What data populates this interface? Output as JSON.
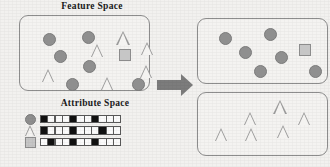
{
  "figure": {
    "width": 330,
    "height": 167,
    "background_color": "#f2f1ef"
  },
  "colors": {
    "shape_fill": "#8f8f8f",
    "shape_outline": "#7b7b7b",
    "triangle_outline": "#9a9a9a",
    "square_fill": "#c6c6c6",
    "square_outline": "#8c8c8c",
    "panel_border": "#8d8d8d",
    "cell_on": "#111111",
    "cell_off": "#fbfbfb",
    "arrow": "#7c7c7c",
    "title_text": "#1a1a1a"
  },
  "panels": {
    "feature_space": {
      "title": "Feature Space",
      "shapes": [
        {
          "type": "circle",
          "x": 24,
          "y": 18,
          "size": 13
        },
        {
          "type": "circle",
          "x": 63,
          "y": 16,
          "size": 13
        },
        {
          "type": "triangle",
          "x": 72,
          "y": 29,
          "size": 13
        },
        {
          "type": "triangle",
          "x": 97,
          "y": 16,
          "size": 14
        },
        {
          "type": "triangle",
          "x": 122,
          "y": 27,
          "size": 13
        },
        {
          "type": "circle",
          "x": 35,
          "y": 35,
          "size": 13
        },
        {
          "type": "square",
          "x": 100,
          "y": 34,
          "size": 12
        },
        {
          "type": "circle",
          "x": 64,
          "y": 45,
          "size": 13
        },
        {
          "type": "triangle",
          "x": 23,
          "y": 54,
          "size": 13
        },
        {
          "type": "triangle",
          "x": 121,
          "y": 50,
          "size": 13
        },
        {
          "type": "circle",
          "x": 47,
          "y": 63,
          "size": 13
        },
        {
          "type": "triangle",
          "x": 82,
          "y": 62,
          "size": 13
        },
        {
          "type": "circle",
          "x": 113,
          "y": 63,
          "size": 13
        }
      ]
    },
    "attribute_space": {
      "title": "Attribute Space",
      "legend": [
        {
          "icon": "circle-icon",
          "shape": "circle"
        },
        {
          "icon": "triangle-icon",
          "shape": "triangle"
        },
        {
          "icon": "square-icon",
          "shape": "square"
        }
      ],
      "rows": [
        {
          "label": "circle-attributes",
          "bits": [
            1,
            0,
            0,
            0,
            1,
            0,
            0,
            1,
            0,
            0,
            0
          ]
        },
        {
          "label": "triangle-attributes",
          "bits": [
            1,
            0,
            0,
            0,
            1,
            0,
            0,
            0,
            1,
            0,
            0
          ]
        },
        {
          "label": "square-attributes",
          "bits": [
            0,
            1,
            0,
            0,
            1,
            0,
            0,
            1,
            0,
            0,
            0
          ]
        }
      ],
      "columns": 11
    },
    "cluster_circles": {
      "title": "",
      "shapes": [
        {
          "type": "circle",
          "x": 22,
          "y": 14,
          "size": 13
        },
        {
          "type": "circle",
          "x": 67,
          "y": 10,
          "size": 13
        },
        {
          "type": "circle",
          "x": 42,
          "y": 28,
          "size": 13
        },
        {
          "type": "square",
          "x": 102,
          "y": 26,
          "size": 12
        },
        {
          "type": "circle",
          "x": 78,
          "y": 33,
          "size": 13
        },
        {
          "type": "circle",
          "x": 57,
          "y": 47,
          "size": 13
        },
        {
          "type": "circle",
          "x": 112,
          "y": 47,
          "size": 13
        }
      ]
    },
    "cluster_triangles": {
      "title": "",
      "shapes": [
        {
          "type": "triangle",
          "x": 76,
          "y": 8,
          "size": 14
        },
        {
          "type": "triangle",
          "x": 47,
          "y": 20,
          "size": 13
        },
        {
          "type": "triangle",
          "x": 101,
          "y": 20,
          "size": 13
        },
        {
          "type": "triangle",
          "x": 18,
          "y": 36,
          "size": 13
        },
        {
          "type": "triangle",
          "x": 48,
          "y": 36,
          "size": 13
        },
        {
          "type": "triangle",
          "x": 80,
          "y": 33,
          "size": 13
        }
      ]
    }
  },
  "arrow": {
    "name": "transformation-arrow",
    "direction": "right"
  }
}
